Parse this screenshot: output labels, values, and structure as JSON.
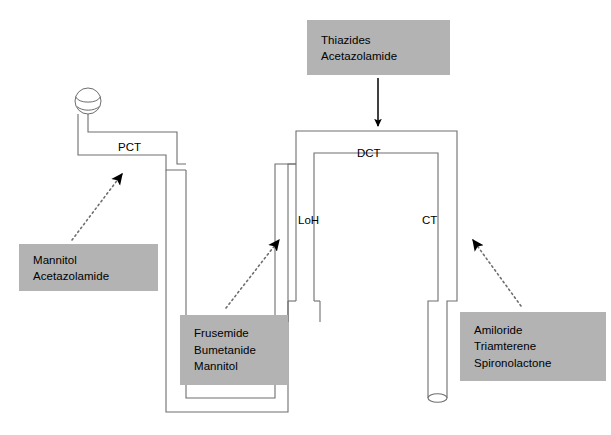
{
  "diagram": {
    "type": "nephron-diuretic-site-of-action",
    "colors": {
      "box_fill": "#b3b3b3",
      "stroke": "#6e6e6e",
      "arrow": "#000000",
      "background": "#ffffff",
      "text": "#000000"
    },
    "structure_labels": [
      {
        "id": "pct",
        "text": "PCT",
        "x": 118,
        "y": 141
      },
      {
        "id": "dct",
        "text": "DCT",
        "x": 357,
        "y": 147
      },
      {
        "id": "loh",
        "text": "LoH",
        "x": 298,
        "y": 220
      },
      {
        "id": "ct",
        "text": "CT",
        "x": 422,
        "y": 220
      }
    ],
    "drug_boxes": [
      {
        "id": "thiazides-box",
        "lines": "Thiazides\nAcetazolamide",
        "x": 307,
        "y": 20,
        "w": 143,
        "h": 55
      },
      {
        "id": "mannitol-box",
        "lines": "Mannitol\nAcetazolamide",
        "x": 19,
        "y": 244,
        "w": 139,
        "h": 47
      },
      {
        "id": "frusemide-box",
        "lines": "Frusemide\nBumetanide\nMannitol",
        "x": 180,
        "y": 315,
        "w": 108,
        "h": 70
      },
      {
        "id": "amiloride-box",
        "lines": "Amiloride\nTriamterene\nSpironolactone",
        "x": 460,
        "y": 312,
        "w": 146,
        "h": 69
      }
    ],
    "arrows": [
      {
        "id": "thiazides-to-dct-arrow",
        "style": "solid",
        "from_label": "Thiazides / Acetazolamide box",
        "to_label": "DCT"
      },
      {
        "id": "mannitol-to-pct-arrow",
        "style": "dotted",
        "from_label": "Mannitol / Acetazolamide box",
        "to_label": "PCT"
      },
      {
        "id": "frusemide-to-loh-arrow",
        "style": "dotted",
        "from_label": "Frusemide / Bumetanide / Mannitol box",
        "to_label": "LoH"
      },
      {
        "id": "amiloride-to-ct-arrow",
        "style": "dotted",
        "from_label": "Amiloride / Triamterene / Spironolactone box",
        "to_label": "CT"
      }
    ],
    "glomerulus": {
      "id": "glomerulus",
      "cx": 88,
      "cy": 101,
      "r": 13
    }
  }
}
